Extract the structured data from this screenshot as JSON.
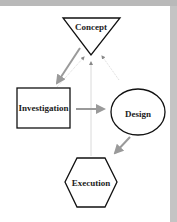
{
  "diagram": {
    "nodes": [
      {
        "id": "concept",
        "label": "Concept",
        "shape": "inverted-triangle"
      },
      {
        "id": "investigation",
        "label": "Investigation",
        "shape": "rectangle"
      },
      {
        "id": "design",
        "label": "Design",
        "shape": "ellipse"
      },
      {
        "id": "execution",
        "label": "Execution",
        "shape": "hexagon"
      }
    ],
    "edges": [
      {
        "from": "concept",
        "to": "investigation",
        "style": "solid-gray-arrow"
      },
      {
        "from": "investigation",
        "to": "design",
        "style": "solid-gray-arrow"
      },
      {
        "from": "design",
        "to": "execution",
        "style": "solid-gray-arrow"
      },
      {
        "from": "investigation",
        "to": "concept",
        "style": "faint-dotted-arrow"
      },
      {
        "from": "execution",
        "to": "concept",
        "style": "faint-dotted-arrow"
      },
      {
        "from": "design",
        "to": "concept",
        "style": "faint-dotted-arrow"
      }
    ],
    "colors": {
      "frame": "#b9b9b9",
      "node_stroke": "#111111",
      "arrow": "#9a9a9a",
      "feedback": "#d6d6d6"
    }
  }
}
